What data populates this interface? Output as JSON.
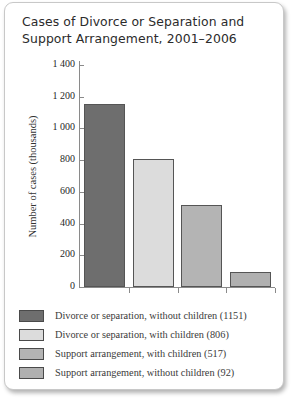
{
  "chart_data": {
    "type": "bar",
    "title": "Cases of Divorce or Separation and Support Arrangement, 2001–2006",
    "title_lines": [
      "Cases of Divorce or Separation and",
      "Support Arrangement, 2001–2006"
    ],
    "xlabel": "",
    "ylabel": "Number of cases (thousands)",
    "ylim": [
      0,
      1400
    ],
    "yticks": [
      0,
      200,
      400,
      600,
      800,
      1000,
      1200,
      1400
    ],
    "ytick_labels": [
      "0",
      "200",
      "400",
      "600",
      "800",
      "1 000",
      "1 200",
      "1 400"
    ],
    "grid": false,
    "legend_position": "below",
    "categories": [
      "Divorce or separation, without children",
      "Divorce or separation, with children",
      "Support arrangement, with children",
      "Support arrangement, without children"
    ],
    "values": [
      1151,
      806,
      517,
      92
    ],
    "colors": [
      "#6e6e6e",
      "#dcdcdc",
      "#b4b4b4",
      "#b0b0b0"
    ],
    "bar_border_color": "#555555",
    "legend": [
      {
        "label": "Divorce or separation, without children (1151)",
        "value": 1151,
        "color": "#6e6e6e"
      },
      {
        "label": "Divorce or separation, with children (806)",
        "value": 806,
        "color": "#dcdcdc"
      },
      {
        "label": "Support arrangement, with children (517)",
        "value": 517,
        "color": "#b4b4b4"
      },
      {
        "label": "Support arrangement, without children (92)",
        "value": 92,
        "color": "#b0b0b0"
      }
    ]
  }
}
